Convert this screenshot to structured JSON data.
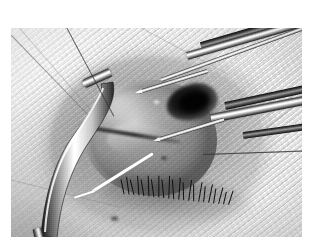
{
  "figure": {
    "kind": "photograph",
    "modality": "color-photograph-grayscale",
    "orientation": "landscape",
    "border_color": "#ffffff",
    "caption": ""
  },
  "photo": {
    "x": 11,
    "y": 28,
    "width": 291,
    "height": 209,
    "tones": {
      "drape_light": "#f3f3f3",
      "drape_mid": "#e2e2e2",
      "tissue_mid": "#8f8f8f",
      "tissue_shadow": "#4a4a4a",
      "pupil_black": "#0c0c0c",
      "metal_highlight": "#ffffff",
      "metal_shadow": "#1d1d1d",
      "suture_white": "#fbfbfb"
    }
  },
  "scene": {
    "regions": [
      {
        "name": "surgical-drape",
        "description": "woven cloth drape with fine diagonal weave covering the face, occupying the perimeter of the frame"
      },
      {
        "name": "orbital-opening",
        "description": "oval aperture cut in the drape exposing the periorbital skin and the globe"
      },
      {
        "name": "globe",
        "description": "exposed eyeball, roughly circular, centre-left of the aperture"
      },
      {
        "name": "pupil",
        "description": "deep black pupil / open anterior chamber at the upper right of the globe"
      },
      {
        "name": "corneal-flap",
        "description": "pale lifted flap of tissue across the mid globe"
      },
      {
        "name": "incision-line",
        "description": "dark curved incision running across the globe"
      },
      {
        "name": "eyelashes",
        "description": "row of dark lashes along the lower lid margin beneath the globe"
      },
      {
        "name": "drape-seam",
        "description": "thin dark fold lines running across the drape"
      }
    ],
    "instruments": [
      {
        "name": "forceps-upper",
        "entry": "upper-right",
        "description": "long straight metal forceps angled down-left toward the globe"
      },
      {
        "name": "forceps-lower",
        "entry": "right",
        "description": "second metal forceps with a fine tapered tip reaching the limbus"
      },
      {
        "name": "needle-holder",
        "entry": "upper-right",
        "description": "slender bright instrument shaft above the globe"
      },
      {
        "name": "lid-retractor",
        "entry": "lower-left",
        "description": "curved metal retractor blade holding the tissue open on the left side"
      }
    ],
    "sutures": [
      {
        "name": "suture-white",
        "description": "bright white suture thread crossing the lower cornea toward the lower left"
      },
      {
        "name": "suture-dark-upper",
        "description": "fine dark thread running diagonally across the upper-left drape"
      },
      {
        "name": "suture-dark-right",
        "description": "fine dark thread running horizontally across the right drape"
      }
    ]
  }
}
